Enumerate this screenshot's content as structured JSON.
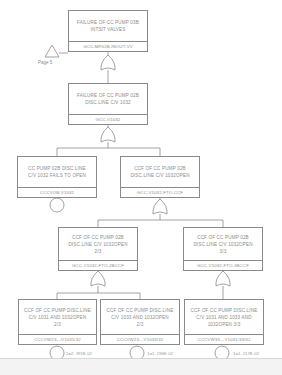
{
  "diagram": {
    "type": "fault-tree",
    "transfer": {
      "label": "Page 5"
    },
    "nodes": [
      {
        "key": "top",
        "desc": "FAILURE OF CC PUMP 03B\nINTSIT VALVES",
        "id": "GCC-MP02B-INOUT-VV",
        "gate": "OR"
      },
      {
        "key": "g1",
        "desc": "FAILURE OF CC PUMP 02B\nDISC.LINE C/V 1032",
        "id": "GCC-V1032",
        "gate": "OR"
      },
      {
        "key": "e1",
        "desc": "CC PUMP 02B DISC.LINE\nC/V 1032 FAILS TO OPEN",
        "id": "CCCVOB-V1032",
        "event": "basic"
      },
      {
        "key": "g2",
        "desc": "CCF OF CC PUMP 02B\nDISC.LINE C/V 1032OPEN",
        "id": "GCC-V1032-FTO-CCF",
        "gate": "OR"
      },
      {
        "key": "g3",
        "desc": "CCF OF CC PUMP 02B\nDISC.LINE C/V 1032OPEN\n2/3",
        "id": "GCC-V1032-FTO-2BCCF",
        "gate": "OR"
      },
      {
        "key": "g4",
        "desc": "CCF OF CC PUMP 02B\nDISC.LINE C/V 1032OPEN\n3/3",
        "id": "GCC-V1032-FTO-3BCCF",
        "gate": "OR"
      },
      {
        "key": "e2",
        "desc": "CCF OF CC PUMP DISC.LINE\nC/V 1031 AND 1032OPEN\n2/3",
        "id": "CCCVW23---V1031/32",
        "event": "basic",
        "prob": "1=2. 391E-02"
      },
      {
        "key": "e3",
        "desc": "CCF OF CC PUMP DISC.LINE\nC/V 1033 AND 1032OPEN\n2/3",
        "id": "CCCVW23---V1033/32",
        "event": "basic",
        "prob": "1=1. 196E-02"
      },
      {
        "key": "e4",
        "desc": "CCF OF CC PUMP DISC.LINE\nC/V 1031 AND 1033 AND\n1032OPEN 3/3",
        "id": "CCCVW33---V1031/33/32",
        "event": "basic",
        "prob": "1=1. 217E-02"
      }
    ]
  },
  "colors": {
    "line": "#8a8a8a",
    "text": "#8c8c8c",
    "background": "#ffffff"
  }
}
